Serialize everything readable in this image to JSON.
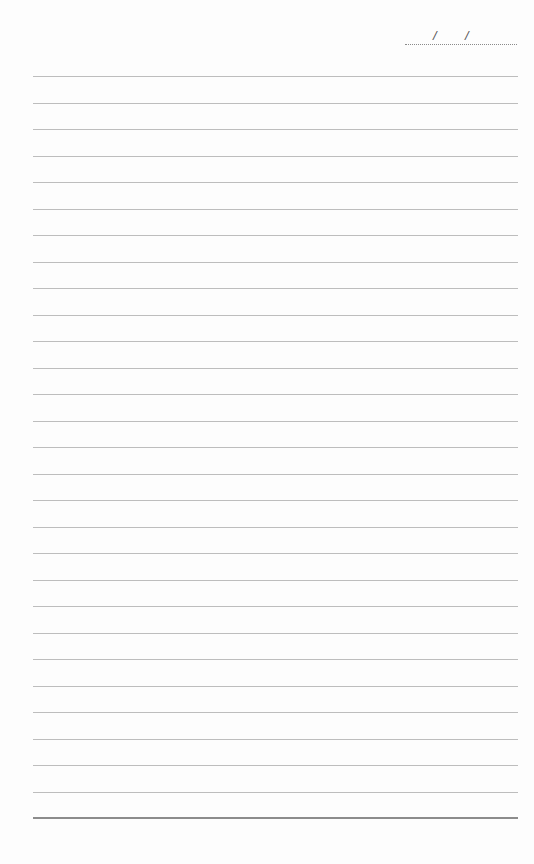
{
  "page": {
    "type": "lined-notebook-page",
    "date_field": {
      "separator_1": "/",
      "separator_2": "/",
      "value": ""
    },
    "ruled_lines": 28,
    "line_color": "#bdbdbd",
    "bottom_rule_color": "#8c8c8c",
    "background": "#fdfdfd"
  }
}
